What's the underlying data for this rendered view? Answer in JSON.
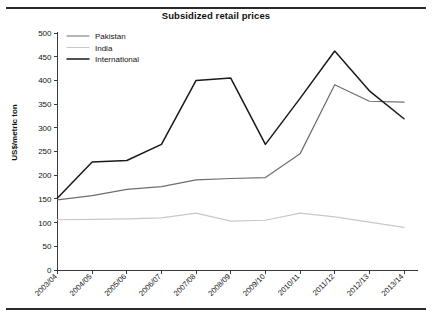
{
  "figure": {
    "title": "Subsidized retail prices",
    "has_top_rule": true,
    "has_bottom_rule": true,
    "background": "#ffffff"
  },
  "axes": {
    "ylabel": "US$/metric ton",
    "xlabel": "",
    "yticks": [
      "0",
      "50",
      "100",
      "150",
      "200",
      "250",
      "300",
      "350",
      "400",
      "450",
      "500"
    ],
    "xticks": [
      "2003/04",
      "2004/05",
      "2005/06",
      "2006/07",
      "2007/08",
      "2008/09",
      "2009/10",
      "2010/11",
      "2011/12",
      "2012/13",
      "2013/14"
    ]
  },
  "legend": {
    "position": "top-left",
    "entries": [
      {
        "label": "Pakistan",
        "color": "#6e6e6e"
      },
      {
        "label": "India",
        "color": "#c8c8c8"
      },
      {
        "label": "International",
        "color": "#1a1a1a"
      }
    ]
  },
  "chart_data": {
    "type": "line",
    "title": "Subsidized retail prices",
    "xlabel": "",
    "ylabel": "US$/metric ton",
    "categories": [
      "2003/04",
      "2004/05",
      "2005/06",
      "2006/07",
      "2007/08",
      "2008/09",
      "2009/10",
      "2010/11",
      "2011/12",
      "2012/13",
      "2013/14"
    ],
    "series": [
      {
        "name": "Pakistan",
        "color": "#6e6e6e",
        "values": [
          148,
          157,
          170,
          176,
          190,
          193,
          195,
          245,
          391,
          356,
          354
        ]
      },
      {
        "name": "India",
        "color": "#c8c8c8",
        "values": [
          106,
          107,
          108,
          110,
          120,
          103,
          105,
          120,
          112,
          101,
          90
        ]
      },
      {
        "name": "International",
        "color": "#1a1a1a",
        "values": [
          152,
          228,
          231,
          265,
          400,
          405,
          265,
          362,
          462,
          378,
          319
        ]
      }
    ],
    "ylim": [
      0,
      500
    ],
    "ytick_step": 50,
    "grid": false,
    "legend_position": "top-left"
  }
}
